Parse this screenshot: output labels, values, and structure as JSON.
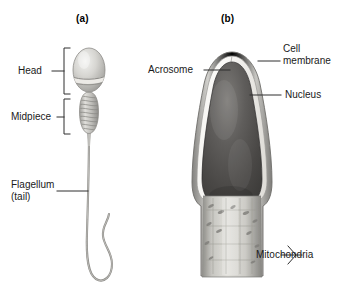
{
  "figure": {
    "background_color": "#ffffff",
    "line_color": "#3a3a3a",
    "text_color": "#1a1a1a"
  },
  "panel_a": {
    "title": "(a)",
    "labels": {
      "head": "Head",
      "midpiece": "Midpiece",
      "flagellum_line1": "Flagellum",
      "flagellum_line2": "(tail)"
    }
  },
  "panel_b": {
    "title": "(b)",
    "labels": {
      "acrosome": "Acrosome",
      "cell_membrane_line1": "Cell",
      "cell_membrane_line2": "membrane",
      "nucleus": "Nucleus",
      "mitochondria": "Mitochondria"
    }
  }
}
